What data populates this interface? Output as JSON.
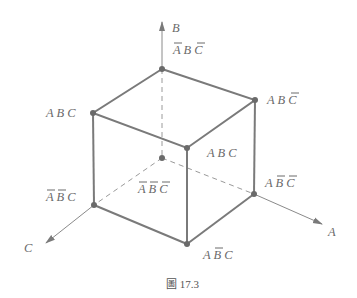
{
  "figure": {
    "caption": "圖 17.3",
    "axes": {
      "a": "A",
      "b": "B",
      "c": "C"
    },
    "vertices": [
      {
        "id": "top-back",
        "label": "A B C",
        "bars": [
          0,
          2
        ]
      },
      {
        "id": "left-top",
        "label": "A B C",
        "bars": []
      },
      {
        "id": "right-top",
        "label": "A B C",
        "bars": [
          2
        ]
      },
      {
        "id": "front-top",
        "label": "A B C",
        "bars": []
      },
      {
        "id": "origin",
        "label": "A B C",
        "bars": [
          0,
          1,
          2
        ]
      },
      {
        "id": "left-bottom",
        "label": "A B C",
        "bars": [
          0,
          1
        ]
      },
      {
        "id": "right-bottom",
        "label": "A B C",
        "bars": [
          1,
          2
        ]
      },
      {
        "id": "front-bottom",
        "label": "A B C",
        "bars": [
          1
        ]
      }
    ],
    "labels": {
      "top_back": "Ā B C̄",
      "left_top": "A B C",
      "right_top": "A B C̄",
      "front_top": "A B C",
      "origin": "Ā B̄ C̄",
      "left_bottom": "Ā B̄ C",
      "right_bottom": "A B̄ C̄",
      "front_bottom": "A B̄ C"
    },
    "colors": {
      "line": "#7a7a7a",
      "text": "#6a6a6a"
    }
  }
}
